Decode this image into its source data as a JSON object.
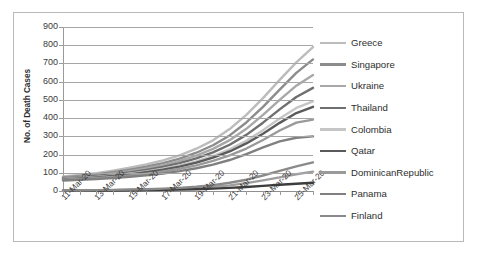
{
  "chart_data": {
    "type": "line",
    "title": "",
    "xlabel": "",
    "ylabel": "No. of Death Cases",
    "ylim": [
      0,
      900
    ],
    "yticks": [
      0,
      100,
      200,
      300,
      400,
      500,
      600,
      700,
      800,
      900
    ],
    "grid": true,
    "legend_position": "right",
    "x": [
      "11-Mar-20",
      "12-Mar-20",
      "13-Mar-20",
      "14-Mar-20",
      "15-Mar-20",
      "16-Mar-20",
      "17-Mar-20",
      "18-Mar-20",
      "19-Mar-20",
      "20-Mar-20",
      "21-Mar-20",
      "22-Mar-20",
      "23-Mar-20",
      "24-Mar-20",
      "25-Mar-20",
      "26-Mar-20"
    ],
    "xtick_labels": [
      "11-Mar-20",
      "13-Mar-20",
      "15-Mar-20",
      "17-Mar-20",
      "19-Mar-20",
      "21-Mar-20",
      "23-Mar-20",
      "25-Mar-20"
    ],
    "series": [
      {
        "name": "Greece",
        "color": "#bcbcbc",
        "values": [
          80,
          88,
          98,
          112,
          128,
          146,
          168,
          196,
          232,
          278,
          340,
          418,
          510,
          610,
          706,
          790
        ]
      },
      {
        "name": "Singapore",
        "color": "#8c8c8c",
        "values": [
          75,
          82,
          91,
          103,
          117,
          133,
          153,
          178,
          210,
          251,
          305,
          376,
          462,
          556,
          648,
          722
        ]
      },
      {
        "name": "Ukraine",
        "color": "#a8a8a8",
        "values": [
          72,
          78,
          86,
          96,
          109,
          124,
          142,
          165,
          194,
          231,
          279,
          341,
          418,
          500,
          578,
          636
        ]
      },
      {
        "name": "Thailand",
        "color": "#6f6f6f",
        "values": [
          70,
          75,
          82,
          91,
          102,
          116,
          132,
          153,
          179,
          212,
          254,
          308,
          375,
          448,
          516,
          566
        ]
      },
      {
        "name": "Colombia",
        "color": "#c6c6c6",
        "values": [
          66,
          71,
          77,
          85,
          95,
          107,
          122,
          140,
          163,
          192,
          229,
          276,
          334,
          398,
          456,
          492
        ]
      },
      {
        "name": "Qatar",
        "color": "#5a5a5a",
        "values": [
          64,
          69,
          75,
          82,
          91,
          103,
          117,
          134,
          156,
          183,
          217,
          261,
          314,
          374,
          428,
          462
        ]
      },
      {
        "name": "DominicanRepublic",
        "color": "#9a9a9a",
        "values": [
          62,
          66,
          71,
          77,
          85,
          95,
          107,
          122,
          141,
          165,
          195,
          233,
          280,
          332,
          375,
          392
        ]
      },
      {
        "name": "Panama",
        "color": "#808080",
        "values": [
          58,
          62,
          66,
          71,
          78,
          86,
          96,
          109,
          125,
          145,
          170,
          202,
          240,
          272,
          292,
          300
        ]
      },
      {
        "name": "Finland",
        "color": "#8a8a8a",
        "values": [
          3,
          4,
          5,
          6,
          8,
          10,
          13,
          17,
          23,
          32,
          45,
          62,
          85,
          110,
          135,
          157
        ]
      }
    ],
    "extra_low_series": [
      {
        "name": "low-band-2",
        "color": "#9e9e9e",
        "values": [
          2,
          3,
          4,
          5,
          6,
          8,
          10,
          13,
          17,
          23,
          31,
          43,
          58,
          75,
          92,
          106
        ]
      },
      {
        "name": "low-band-3",
        "color": "#3d3d3d",
        "values": [
          1,
          2,
          2,
          3,
          4,
          5,
          6,
          8,
          10,
          13,
          17,
          22,
          28,
          34,
          40,
          45
        ]
      }
    ]
  },
  "legend": {
    "items": [
      {
        "label": "Greece"
      },
      {
        "label": "Singapore"
      },
      {
        "label": "Ukraine"
      },
      {
        "label": "Thailand"
      },
      {
        "label": "Colombia"
      },
      {
        "label": "Qatar"
      },
      {
        "label": "DominicanRepublic"
      },
      {
        "label": "Panama"
      },
      {
        "label": "Finland"
      }
    ]
  }
}
